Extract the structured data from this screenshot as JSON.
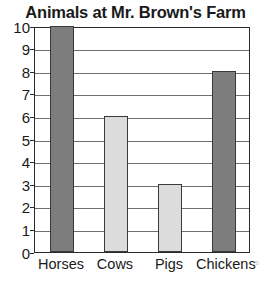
{
  "chart_data": {
    "type": "bar",
    "title": "Animals at Mr. Brown's Farm",
    "xlabel": "",
    "ylabel": "",
    "categories": [
      "Horses",
      "Cows",
      "Pigs",
      "Chickens"
    ],
    "values": [
      10,
      6,
      3,
      8
    ],
    "bar_colors": [
      "#7d7d7d",
      "#dcdcdc",
      "#dcdcdc",
      "#7d7d7d"
    ],
    "ylim": [
      0,
      10
    ],
    "ytick_labels": [
      "10",
      "9",
      "8",
      "7",
      "6",
      "5",
      "4",
      "3",
      "2",
      "1",
      "0"
    ],
    "ytick_values": [
      10,
      9,
      8,
      7,
      6,
      5,
      4,
      3,
      2,
      1,
      0
    ],
    "grid": true,
    "legend": false,
    "axis_color": "#2b2b2b",
    "gridline_color": "#6f6f6f",
    "bar_border_color": "#3a3a3a",
    "text_color": "#1a1a1a",
    "background": "#ffffff"
  },
  "corner": {
    "artifact_text": "s"
  }
}
